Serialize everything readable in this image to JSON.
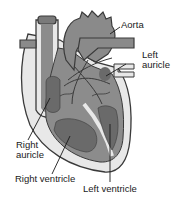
{
  "diagram": {
    "labels": {
      "aorta": "Aorta",
      "left_auricle_line1": "Left",
      "left_auricle_line2": "auricle",
      "right_auricle_line1": "Right",
      "right_auricle_line2": "auricle",
      "right_ventricle": "Right ventricle",
      "left_ventricle": "Left ventricle"
    },
    "colors": {
      "outline": "#3a3a3a",
      "wall": "#e6e6e6",
      "muscle": "#8c8c8c",
      "chamber": "#6e6e6e",
      "vessel": "#8a8a8a"
    }
  }
}
